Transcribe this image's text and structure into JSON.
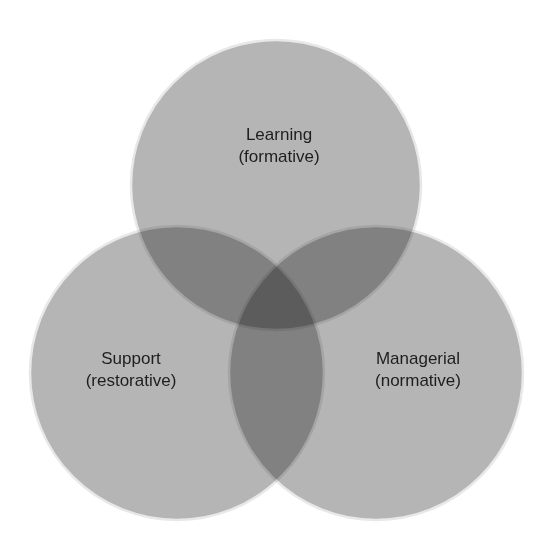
{
  "diagram": {
    "type": "venn",
    "sets": [
      {
        "id": "learning",
        "title": "Learning",
        "subtitle": "(formative)",
        "cx": 276,
        "cy": 185,
        "r": 145
      },
      {
        "id": "support",
        "title": "Support",
        "subtitle": "(restorative)",
        "cx": 177,
        "cy": 373,
        "r": 147
      },
      {
        "id": "managerial",
        "title": "Managerial",
        "subtitle": "(normative)",
        "cx": 376,
        "cy": 373,
        "r": 147
      }
    ],
    "colors": {
      "fill": "#9a9a9a",
      "outline": "#e6e6e6",
      "text": "#1e1e1e"
    }
  }
}
